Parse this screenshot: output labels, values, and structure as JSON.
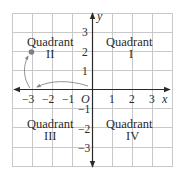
{
  "diagram": {
    "axes": {
      "x_label": "x",
      "y_label": "y",
      "origin_label": "O",
      "x_ticks": [
        "−3",
        "−2",
        "−1",
        "1",
        "2",
        "3"
      ],
      "y_ticks_positive": [
        "1",
        "2",
        "3"
      ],
      "y_ticks_negative": [
        "−1",
        "−2",
        "−3"
      ],
      "range": {
        "xmin": -4,
        "xmax": 4,
        "ymin": -4,
        "ymax": 4
      }
    },
    "quadrants": {
      "q1": {
        "word": "Quadrant",
        "numeral": "I"
      },
      "q2": {
        "word": "Quadrant",
        "numeral": "II"
      },
      "q3": {
        "word": "Quadrant",
        "numeral": "III"
      },
      "q4": {
        "word": "Quadrant",
        "numeral": "IV"
      }
    },
    "point": {
      "x": -3,
      "y": 2
    },
    "colors": {
      "grid": "#c8c8c8",
      "axis": "#2a2a2a",
      "point": "#808080",
      "path_arrow": "#888888",
      "text": "#2a2a2a"
    }
  }
}
